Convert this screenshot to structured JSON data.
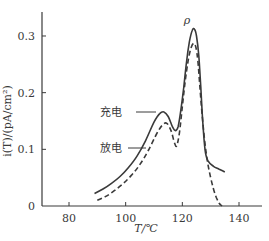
{
  "chart_data": {
    "type": "line",
    "title": "",
    "xlabel": "T/℃",
    "ylabel": "i(T)/(pA/cm²)",
    "xlim": [
      70,
      148
    ],
    "ylim": [
      0,
      0.34
    ],
    "x_ticks": [
      80,
      100,
      120,
      140
    ],
    "x_tick_labels": [
      "80",
      "100",
      "120",
      "140"
    ],
    "y_ticks": [
      0,
      0.1,
      0.2,
      0.3
    ],
    "y_tick_labels": [
      "0",
      "0.1",
      "0.2",
      "0.3"
    ],
    "grid": false,
    "annotations": [
      {
        "text": "ρ",
        "x": 124,
        "y": 0.325
      }
    ],
    "series": [
      {
        "name": "充电",
        "style": "solid",
        "color": "#3a3a3a",
        "x": [
          89,
          92,
          95,
          98,
          101,
          104,
          107,
          110,
          112,
          113.5,
          115,
          116.5,
          117.5,
          118.5,
          119.5,
          120.5,
          121.5,
          122.5,
          123.5,
          124.3,
          125,
          125.8,
          126.5,
          127.2,
          128,
          129,
          131,
          133,
          135
        ],
        "values": [
          0.022,
          0.03,
          0.04,
          0.052,
          0.068,
          0.088,
          0.115,
          0.148,
          0.163,
          0.166,
          0.158,
          0.14,
          0.133,
          0.14,
          0.17,
          0.21,
          0.255,
          0.29,
          0.31,
          0.312,
          0.3,
          0.265,
          0.21,
          0.15,
          0.1,
          0.08,
          0.07,
          0.065,
          0.06
        ]
      },
      {
        "name": "放电",
        "style": "dashed",
        "color": "#3a3a3a",
        "x": [
          90,
          93,
          96,
          99,
          102,
          105,
          108,
          111,
          113,
          114.5,
          116,
          117.2,
          118,
          119,
          120,
          121,
          122,
          123,
          124,
          124.8,
          125.5,
          126.2,
          127,
          128,
          129,
          130,
          131,
          132,
          133,
          134
        ],
        "values": [
          0.01,
          0.017,
          0.027,
          0.039,
          0.054,
          0.073,
          0.098,
          0.128,
          0.143,
          0.146,
          0.133,
          0.112,
          0.106,
          0.13,
          0.175,
          0.22,
          0.255,
          0.278,
          0.287,
          0.28,
          0.255,
          0.21,
          0.16,
          0.11,
          0.075,
          0.05,
          0.03,
          0.015,
          0.005,
          0
        ]
      }
    ],
    "legend_position": "inline-labels-left"
  },
  "labels": {
    "charge": "充电",
    "discharge": "放电",
    "peak": "ρ",
    "xlabel": "T/℃",
    "ylabel": "i(T)/(pA/cm²)"
  }
}
